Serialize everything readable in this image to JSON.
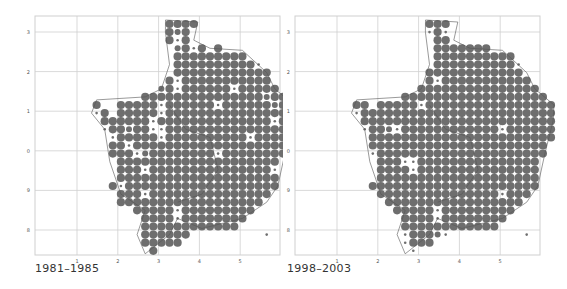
{
  "figure": {
    "type": "distribution-map-pair",
    "dot_color": "#6e6e6e",
    "grid_color": "#cfcfcf",
    "outline_color": "#555555"
  },
  "panels": [
    {
      "caption": "1981–1985",
      "x_ticks": [
        "1",
        "2",
        "3",
        "4",
        "5"
      ],
      "y_ticks": [
        "3",
        "2",
        "1",
        "0",
        "9",
        "8"
      ],
      "dots": [
        "...............LLLL.........",
        "...............LML..........",
        "...............LsL..........",
        "................MLsL.L......",
        "................LLLLLLLLL...",
        "................LLLLLLLLLLs.",
        "................LLLLLLLLLLLL",
        "...............LsLLLLLLLLLLL",
        "..............MLsLLLLLLsLLLLL",
        "............LLLLLLLLLLLLLLLMLL",
        "......L..LLLLLsLLLLLLsLLLLLLMLL",
        "......sL.LLLLLsLLLLLLLLLLLLLLLL",
        ".......LLLLLLsLLLLLLLLLLLLLLsLL",
        ".......sLLMLLssLLLLLLLLLLLLLLL",
        "........sLLLLLsLLLLLLLLLLsLLLLL",
        "........LLsLLLLLLLLLLLLLLLLLLL",
        "........LLLsMLLLLLLLLsLLLLLLLL",
        ".........LLLLLLLLLLLLLLLLLLLL.",
        ".........LLLsLLLLLLLLLLLLLLLs.",
        ".........LLLLLLLLLLLLLLLLLLLL.",
        "........LsLLLLLLLLLLLLLLLLLLL.",
        ".........LLLsLLLLLLLLLLLLLLL..",
        ".........LLLLLLLLLLLLLLLLLL...",
        "...........LLLLLsLLLLLLLLL....",
        "............LLLLsLLLLLLLL.....",
        "............LLLLLLLLLLLL......",
        "............LLLLLL.........s..",
        "............LLLLL.............",
        ".............L................"
      ]
    },
    {
      "caption": "1998–2003",
      "x_ticks": [
        "1",
        "2",
        "3",
        "4",
        "5"
      ],
      "y_ticks": [
        "3",
        "2",
        "1",
        "0",
        "9",
        "8"
      ],
      "dots": [
        "...............LLL..........",
        "...............sLs..........",
        "................LL..........",
        "................LLLLLLL.....",
        "................LLLLLLLLLL..",
        "................LLLLLLLLLLs.",
        "...............LLLLLLLLLLLL.",
        "...............LsLLLLLLLLLLL",
        "..............LLLLLLLLLLLLLLL",
        "............LLLLLLLLLLLLLLLLLL",
        "......LL.LLLLLsLLLLLLLLLLLLLLLL",
        "......sLLLLLLLLLLLLLLLLLLLLLLLL",
        ".......LLLLLLLLLLLLLLLLLLLLLLLL",
        ".......sLLMsLLLLLLLLLLLLsLLLLLL",
        "........LLLLLLLLLLLLLLLLLLLLLLL",
        "........LLLLLLLLLLLLLLLLLLLLLL",
        "........sLLLLLLLLLLLLLLLLLLLLL",
        ".........LLLssLLLLLLLLLLLLLLL.",
        ".........LLLLsLLLLLLLLLLLLLLL.",
        ".........LLLLLLLLLLLLLLLLLLLL.",
        "........LLLLLLLLLLLLLLLLLLLLL.",
        ".........LLLLLLLLLLLLLLLsLLL..",
        "..........LLLLLLLLLLLLLLLLL...",
        "...........LLLLLsLLLLLLLLL....",
        "............LLLLsLLLLLLLL.....",
        "............LLLLLLLLLLLL......",
        "............sLLLMs.........s..",
        "............sLLL..............",
        ".............s................"
      ]
    }
  ]
}
